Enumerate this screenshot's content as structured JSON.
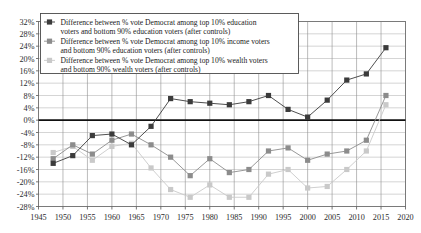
{
  "chart_data": {
    "type": "line",
    "title": "",
    "subtitle": "",
    "xlabel": "",
    "ylabel": "",
    "xlim": [
      1945,
      2020
    ],
    "ylim": [
      -28,
      32
    ],
    "y_tick_step": 4,
    "x_tick_step": 5,
    "grid": true,
    "zero_line": true,
    "legend_position": "upper-left",
    "y_ticks": [
      "32%",
      "28%",
      "24%",
      "20%",
      "16%",
      "12%",
      "8%",
      "4%",
      "0%",
      "-4%",
      "-8%",
      "-12%",
      "-16%",
      "-20%",
      "-24%",
      "-28%"
    ],
    "x_ticks": [
      "1945",
      "1950",
      "1955",
      "1960",
      "1965",
      "1970",
      "1975",
      "1980",
      "1985",
      "1990",
      "1995",
      "2000",
      "2005",
      "2010",
      "2015",
      "2020"
    ],
    "x": [
      1948,
      1952,
      1956,
      1960,
      1964,
      1968,
      1972,
      1976,
      1980,
      1984,
      1988,
      1992,
      1996,
      2000,
      2004,
      2008,
      2012,
      2016
    ],
    "series": [
      {
        "name": "Difference between % vote Democrat among top 10% education voters and bottom 90% education voters (after controls)",
        "color": "#3b3b3b",
        "marker": "square",
        "values": [
          -14,
          -11.5,
          -5,
          -4.5,
          -8,
          -2,
          7,
          6,
          5.5,
          5,
          6,
          8,
          3.5,
          1,
          6.5,
          13,
          15,
          23.5
        ]
      },
      {
        "name": "Difference between % vote Democrat among top 10% income voters and bottom 90% education voters (after controls)",
        "color": "#8c8c8c",
        "marker": "square",
        "values": [
          -12.5,
          -8,
          -11,
          -6.5,
          -4.5,
          -8,
          -12,
          -18,
          -12.5,
          -17,
          -16,
          -10,
          -9,
          -13,
          -11,
          -10,
          -6.5,
          8
        ]
      },
      {
        "name": "Difference between % vote Democrat among top 10% wealth voters and bottom 90% wealth voters (after controls)",
        "color": "#c9c9c9",
        "marker": "square",
        "values": [
          -10.5,
          -8.5,
          -13,
          -8.5,
          -7.5,
          -15.5,
          -22.5,
          -25,
          -21,
          -25,
          -25,
          -17.5,
          -16,
          -22,
          -21.5,
          -16,
          -10,
          5
        ]
      }
    ]
  },
  "legend": {
    "entries": [
      {
        "line1": "Difference between % vote Democrat among top 10% education",
        "line2": "voters and bottom 90% education voters (after controls)"
      },
      {
        "line1": "Difference between % vote Democrat among top 10% income voters",
        "line2": "and bottom 90% education voters (after controls)"
      },
      {
        "line1": "Difference between % vote Democrat among top 10% wealth voters",
        "line2": "and bottom 90% wealth voters (after controls)"
      }
    ]
  }
}
